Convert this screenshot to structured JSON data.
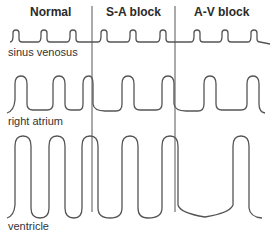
{
  "figure": {
    "columns": [
      {
        "label": "Normal"
      },
      {
        "label": "S-A block"
      },
      {
        "label": "A-V block"
      }
    ],
    "traces": [
      {
        "label": "sinus venosus"
      },
      {
        "label": "right atrium"
      },
      {
        "label": "ventricle"
      }
    ],
    "colors": {
      "trace": "#555555",
      "text": "#2a2a2a",
      "background": "#ffffff"
    }
  }
}
